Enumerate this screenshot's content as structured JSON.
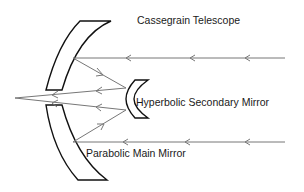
{
  "diagram": {
    "title": "Cassegrain Telescope",
    "labels": {
      "secondary_mirror": "Hyperbolic Secondary Mirror",
      "main_mirror": "Parabolic Main Mirror"
    },
    "colors": {
      "mirror_outline": "#111111",
      "ray": "#777777",
      "text": "#1a1a1a"
    }
  }
}
